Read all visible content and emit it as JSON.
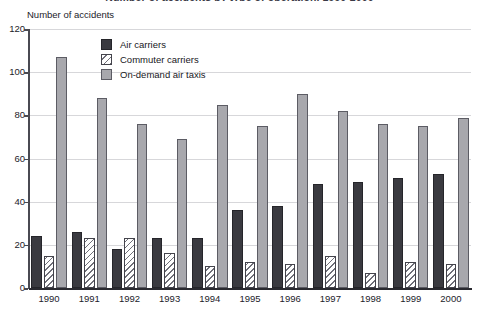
{
  "chart_data": {
    "type": "bar",
    "title": "Number of accidents by type of operation, 1990-2000",
    "xlabel": "",
    "ylabel": "Number of accidents",
    "ylim": [
      0,
      120
    ],
    "ytick_step": 20,
    "yticks": [
      "120",
      "100",
      "80",
      "60",
      "40",
      "20",
      "0"
    ],
    "grid": true,
    "legend_position": "top-center-inside",
    "categories": [
      "1990",
      "1991",
      "1992",
      "1993",
      "1994",
      "1995",
      "1996",
      "1997",
      "1998",
      "1999",
      "2000"
    ],
    "series": [
      {
        "name": "Air carriers",
        "color": "#3a3a40",
        "fill": "solid-dark",
        "values": [
          24,
          26,
          18,
          23,
          23,
          36,
          38,
          48,
          49,
          51,
          53
        ]
      },
      {
        "name": "Commuter carriers",
        "color": "#ffffff",
        "fill": "white-diagonal-hatch",
        "values": [
          15,
          23,
          23,
          16,
          10,
          12,
          11,
          15,
          7,
          12,
          11
        ]
      },
      {
        "name": "On-demand air taxis",
        "color": "#a8a8ad",
        "fill": "solid-gray",
        "values": [
          107,
          88,
          76,
          69,
          85,
          75,
          90,
          82,
          76,
          75,
          79
        ]
      }
    ]
  },
  "axis": {
    "y_title": "Number of accidents"
  },
  "legend": {
    "items": [
      {
        "label": "Air carriers",
        "swatch": "air"
      },
      {
        "label": "Commuter carriers",
        "swatch": "commuter"
      },
      {
        "label": "On-demand air taxis",
        "swatch": "taxi"
      }
    ]
  }
}
